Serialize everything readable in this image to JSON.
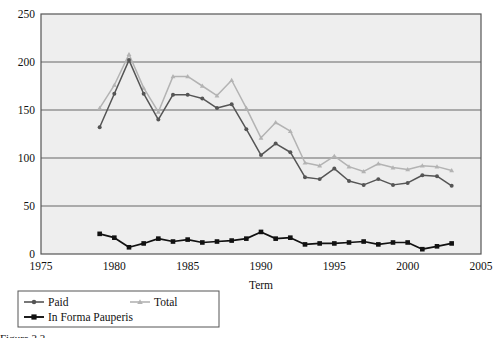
{
  "chart_data": {
    "type": "line",
    "title": "",
    "xlabel": "Term",
    "ylabel": "",
    "xlim": [
      1975,
      2005
    ],
    "ylim": [
      0,
      250
    ],
    "ytick_step": 50,
    "xtick_step": 5,
    "yticks": [
      "0",
      "50",
      "100",
      "150",
      "200",
      "250"
    ],
    "xticks": [
      "1975",
      "1980",
      "1985",
      "1990",
      "1995",
      "2000",
      "2005"
    ],
    "grid": "horizontal",
    "legend_position": "bottom-left",
    "x": [
      1979,
      1980,
      1981,
      1982,
      1983,
      1984,
      1985,
      1986,
      1987,
      1988,
      1989,
      1990,
      1991,
      1992,
      1993,
      1994,
      1995,
      1996,
      1997,
      1998,
      1999,
      2000,
      2001,
      2002,
      2003
    ],
    "series": [
      {
        "name": "Paid",
        "color": "#555555",
        "marker": "circle",
        "values": [
          132,
          167,
          202,
          167,
          140,
          166,
          166,
          162,
          152,
          156,
          130,
          103,
          115,
          106,
          80,
          78,
          89,
          76,
          72,
          78,
          72,
          74,
          82,
          81,
          71
        ]
      },
      {
        "name": "Total",
        "color": "#b3b3b3",
        "marker": "triangle",
        "values": [
          152,
          176,
          208,
          173,
          148,
          185,
          185,
          175,
          165,
          181,
          152,
          121,
          137,
          128,
          95,
          92,
          102,
          91,
          86,
          94,
          90,
          88,
          92,
          91,
          87
        ]
      },
      {
        "name": "In Forma Pauperis",
        "color": "#111111",
        "marker": "square",
        "values": [
          21,
          17,
          7,
          11,
          16,
          13,
          15,
          12,
          13,
          14,
          16,
          23,
          16,
          17,
          10,
          11,
          11,
          12,
          13,
          10,
          12,
          12,
          5,
          8,
          11
        ]
      }
    ]
  },
  "axis": {
    "x_title": "Term"
  },
  "legend": {
    "entries": [
      {
        "label": "Paid"
      },
      {
        "label": "Total"
      },
      {
        "label": "In Forma Pauperis"
      }
    ]
  },
  "caption": {
    "text": "Figure 2.2."
  },
  "colors": {
    "plot_background": "#eeeeee",
    "grid": "#666666",
    "frame": "#555555",
    "paid": "#555555",
    "total": "#b3b3b3",
    "ifp": "#111111"
  }
}
